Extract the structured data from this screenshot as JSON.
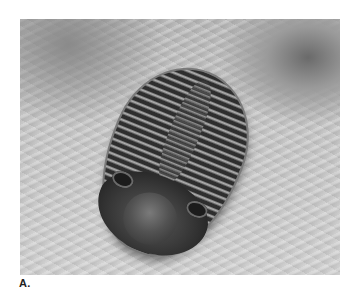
{
  "figure": {
    "label": "A."
  }
}
